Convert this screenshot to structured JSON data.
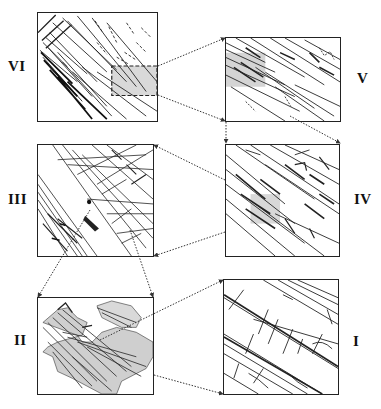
{
  "figure": {
    "panels": [
      {
        "id": "VI",
        "label": "VI",
        "position": "top-left",
        "has_highlight_region": true
      },
      {
        "id": "V",
        "label": "V",
        "position": "top-right",
        "zoom_of": "VI"
      },
      {
        "id": "III",
        "label": "III",
        "position": "middle-left",
        "zoom_of": "IV"
      },
      {
        "id": "IV",
        "label": "IV",
        "position": "middle-right",
        "zoom_of": "V"
      },
      {
        "id": "II",
        "label": "II",
        "position": "bottom-left",
        "zoom_of": "III"
      },
      {
        "id": "I",
        "label": "I",
        "position": "bottom-right",
        "zoom_of": "II"
      }
    ],
    "connector_style": "dotted-arrow",
    "colors": {
      "line": "#222222",
      "highlight": "#d6d6d6",
      "background": "#ffffff"
    }
  }
}
